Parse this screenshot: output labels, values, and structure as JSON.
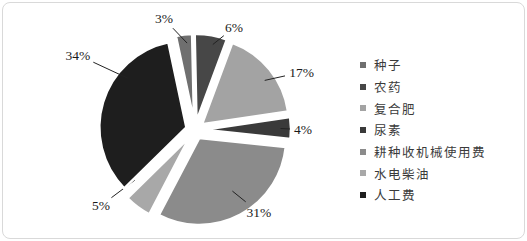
{
  "frame": {
    "background": "#ffffff",
    "border_color": "#d9d9d9"
  },
  "chart_data": {
    "type": "pie",
    "unit": "percent",
    "legend_position": "right",
    "start_angle_deg": -12,
    "exploded": true,
    "slices": [
      {
        "label": "种子",
        "value": 3,
        "percent_label": "3%",
        "color": "#6f6f6f"
      },
      {
        "label": "农药",
        "value": 6,
        "percent_label": "6%",
        "color": "#474747"
      },
      {
        "label": "复合肥",
        "value": 17,
        "percent_label": "17%",
        "color": "#a3a3a3"
      },
      {
        "label": "尿素",
        "value": 4,
        "percent_label": "4%",
        "color": "#3a3a3a"
      },
      {
        "label": "耕种收机械使用费",
        "value": 31,
        "percent_label": "31%",
        "color": "#8b8b8b"
      },
      {
        "label": "水电柴油",
        "value": 5,
        "percent_label": "5%",
        "color": "#a8a8a8"
      },
      {
        "label": "人工费",
        "value": 34,
        "percent_label": "34%",
        "color": "#1e1e1e"
      }
    ]
  }
}
